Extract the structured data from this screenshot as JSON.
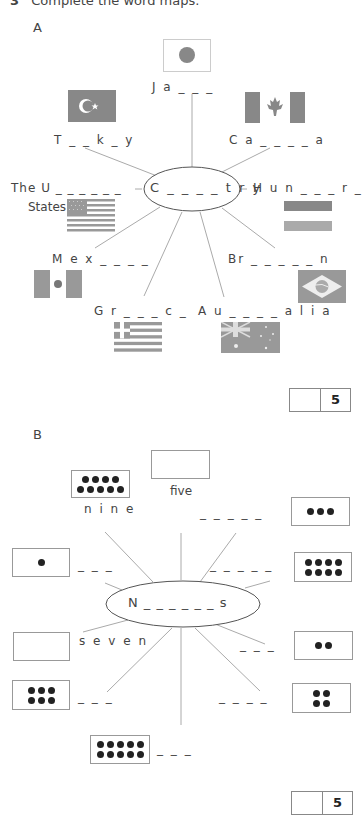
{
  "header": {
    "number": "3",
    "title": "Complete the word maps."
  },
  "section_a": {
    "label": "A",
    "center_word": "C _ _ _ _ t r y",
    "items": [
      {
        "id": "japan",
        "text": "J a _ _ _",
        "flag": "japan-flag-icon"
      },
      {
        "id": "turkey",
        "text": "T _ _ k _ y",
        "flag": "turkey-flag-icon"
      },
      {
        "id": "canada",
        "text": "C a _ _ _ _ a",
        "flag": "canada-flag-icon"
      },
      {
        "id": "usa",
        "text": "The U _ _ _ _ _ _",
        "text2": "States",
        "flag": "usa-flag-icon"
      },
      {
        "id": "hungary",
        "text": "H u n _ _ _ r _",
        "flag": "hungary-flag-icon"
      },
      {
        "id": "mexico",
        "text": "M e x _ _ _ _",
        "flag": "mexico-flag-icon"
      },
      {
        "id": "brazil",
        "text": "Br _ _ _ _ _ n",
        "flag": "brazil-flag-icon"
      },
      {
        "id": "greece",
        "text": "G r _ _ _ c _",
        "flag": "greece-flag-icon"
      },
      {
        "id": "australia",
        "text": "A u _ _ _ _ a l i a",
        "flag": "australia-flag-icon"
      }
    ],
    "score": "5"
  },
  "section_b": {
    "label": "B",
    "center_word": "N _ _ _ _ _ _ s",
    "items": [
      {
        "id": "nine",
        "text": "n i n e",
        "dots": 9
      },
      {
        "id": "five",
        "text": "five",
        "dots": 0
      },
      {
        "id": "three",
        "text": "_ _ _ _ _",
        "dots": 3
      },
      {
        "id": "one",
        "text": "_ _ _",
        "dots": 1
      },
      {
        "id": "eight",
        "text": "_ _ _ _ _",
        "dots": 8
      },
      {
        "id": "seven",
        "text": "s e v e n",
        "dots": 0
      },
      {
        "id": "two",
        "text": "_ _ _",
        "dots": 2
      },
      {
        "id": "six",
        "text": "_ _ _",
        "dots": 6
      },
      {
        "id": "four",
        "text": "_ _ _ _",
        "dots": 4
      },
      {
        "id": "ten",
        "text": "_ _ _",
        "dots": 10
      }
    ],
    "score": "5"
  }
}
